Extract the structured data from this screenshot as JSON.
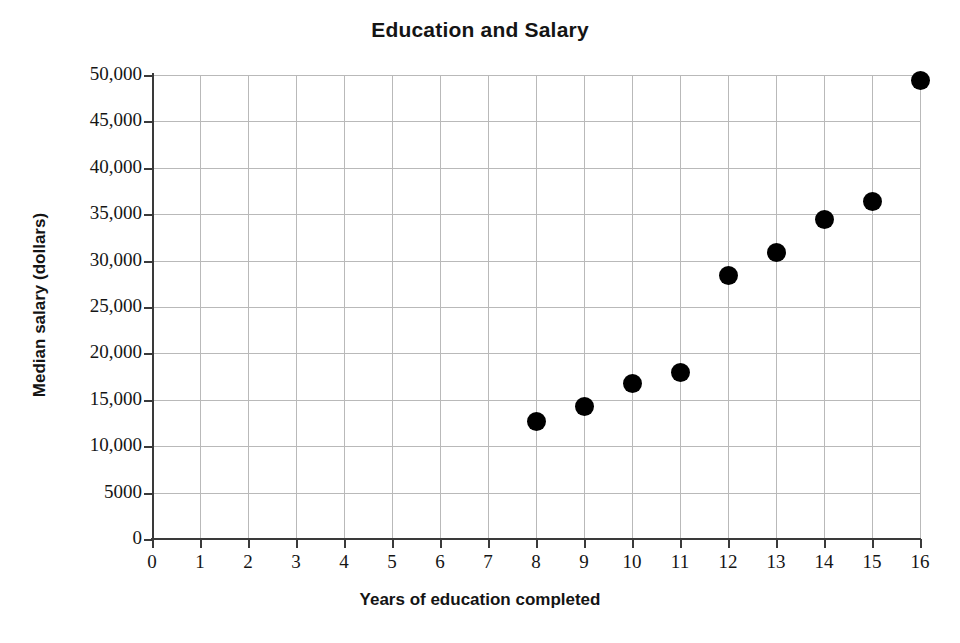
{
  "chart_data": {
    "type": "scatter",
    "title": "Education and Salary",
    "xlabel": "Years of education completed",
    "ylabel": "Median salary (dollars)",
    "xlim": [
      0,
      16
    ],
    "ylim": [
      0,
      50000
    ],
    "grid": true,
    "legend": "none",
    "marker": "filled-circle",
    "marker_color": "#000000",
    "x": [
      8,
      9,
      10,
      11,
      12,
      13,
      14,
      15,
      16
    ],
    "y": [
      12700,
      14300,
      16800,
      17900,
      28400,
      30900,
      34400,
      36400,
      49400
    ],
    "points": [
      {
        "x": 8,
        "y": 12700
      },
      {
        "x": 9,
        "y": 14300
      },
      {
        "x": 10,
        "y": 16800
      },
      {
        "x": 11,
        "y": 17900
      },
      {
        "x": 12,
        "y": 28400
      },
      {
        "x": 13,
        "y": 30900
      },
      {
        "x": 14,
        "y": 34400
      },
      {
        "x": 15,
        "y": 36400
      },
      {
        "x": 16,
        "y": 49400
      }
    ],
    "xticks": [
      0,
      1,
      2,
      3,
      4,
      5,
      6,
      7,
      8,
      9,
      10,
      11,
      12,
      13,
      14,
      15,
      16
    ],
    "xtick_labels": [
      "0",
      "1",
      "2",
      "3",
      "4",
      "5",
      "6",
      "7",
      "8",
      "9",
      "10",
      "11",
      "12",
      "13",
      "14",
      "15",
      "16"
    ],
    "yticks": [
      0,
      5000,
      10000,
      15000,
      20000,
      25000,
      30000,
      35000,
      40000,
      45000,
      50000
    ],
    "ytick_labels": [
      "0",
      "5000",
      "10,000",
      "15,000",
      "20,000",
      "25,000",
      "30,000",
      "35,000",
      "40,000",
      "45,000",
      "50,000"
    ],
    "gridline_color": "#b9b9b9",
    "axis_color": "#3a3a3a",
    "background": "#ffffff"
  }
}
